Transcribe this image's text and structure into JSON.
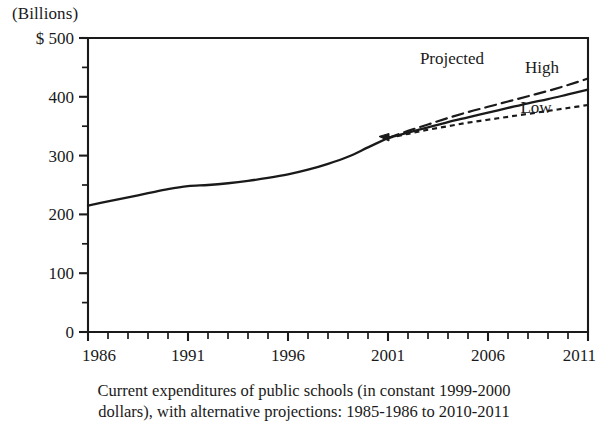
{
  "chart_data": {
    "type": "line",
    "title": "",
    "unit_label": "(Billions)",
    "axis_prefix": "$",
    "xlabel": "",
    "ylabel": "",
    "xlim": [
      1986,
      2011
    ],
    "ylim": [
      0,
      500
    ],
    "grid": false,
    "legend_position": "inline-right",
    "x_tick_labels": [
      "1986",
      "1991",
      "1996",
      "2001",
      "2006",
      "2011"
    ],
    "x_tick_values": [
      1986,
      1991,
      1996,
      2001,
      2006,
      2011
    ],
    "x_minor_tick_interval": 1,
    "y_tick_labels": [
      "0",
      "100",
      "200",
      "300",
      "400",
      "500"
    ],
    "y_tick_values": [
      0,
      100,
      200,
      300,
      400,
      500
    ],
    "y_minor_tick_interval": 50,
    "annotations": [
      {
        "name": "projected",
        "text": "Projected",
        "x": 2004.2,
        "y": 455
      },
      {
        "name": "high",
        "text": "High",
        "x": 2008.7,
        "y": 440
      },
      {
        "name": "low",
        "text": "Low",
        "x": 2008.4,
        "y": 372
      }
    ],
    "series": [
      {
        "name": "Actual",
        "style": "solid",
        "x": [
          1986,
          1987,
          1988,
          1989,
          1990,
          1991,
          1992,
          1993,
          1994,
          1995,
          1996,
          1997,
          1998,
          1999,
          2000,
          2001
        ],
        "values": [
          215,
          222,
          229,
          236,
          243,
          248,
          250,
          253,
          257,
          262,
          268,
          276,
          286,
          298,
          314,
          330
        ]
      },
      {
        "name": "High",
        "style": "dashed",
        "x": [
          2001,
          2002,
          2003,
          2004,
          2005,
          2006,
          2007,
          2008,
          2009,
          2010,
          2011
        ],
        "values": [
          330,
          342,
          353,
          364,
          374,
          383,
          392,
          401,
          410,
          420,
          431
        ]
      },
      {
        "name": "Middle",
        "style": "solid",
        "x": [
          2001,
          2002,
          2003,
          2004,
          2005,
          2006,
          2007,
          2008,
          2009,
          2010,
          2011
        ],
        "values": [
          330,
          339,
          348,
          357,
          365,
          373,
          381,
          389,
          396,
          404,
          412
        ]
      },
      {
        "name": "Low",
        "style": "dotted",
        "x": [
          2001,
          2002,
          2003,
          2004,
          2005,
          2006,
          2007,
          2008,
          2009,
          2010,
          2011
        ],
        "values": [
          330,
          337,
          344,
          350,
          356,
          361,
          366,
          371,
          376,
          381,
          386
        ]
      }
    ]
  },
  "caption": {
    "line1": "Current expenditures of public schools (in constant 1999-2000",
    "line2": "dollars), with alternative projections: 1985-1986 to 2010-2011"
  },
  "colors": {
    "ink": "#1a1a1a",
    "background": "#ffffff"
  }
}
